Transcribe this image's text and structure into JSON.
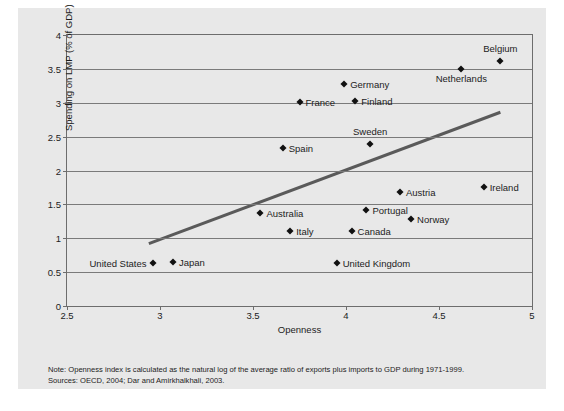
{
  "figure": {
    "background_color": "#e8e8e8",
    "note_line1": "Note: Openness index is calculated as the natural log of the average ratio of exports plus imports to GDP during 1971-1999.",
    "note_line2": "Sources: OECD, 2004; Dar and Amirkhalkhali, 2003."
  },
  "chart_data": {
    "type": "scatter",
    "title": "",
    "xlabel": "Openness",
    "ylabel": "Spending on LMP (% of GDP)",
    "xlim": [
      2.5,
      5
    ],
    "ylim": [
      0,
      4
    ],
    "xticks": [
      "2.5",
      "3",
      "3.5",
      "4",
      "4.5",
      "5"
    ],
    "xtick_values": [
      2.5,
      3,
      3.5,
      4,
      4.5,
      5
    ],
    "yticks": [
      "0",
      "0.5",
      "1",
      "1.5",
      "2",
      "2.5",
      "3",
      "3.5",
      "4"
    ],
    "ytick_values": [
      0,
      0.5,
      1,
      1.5,
      2,
      2.5,
      3,
      3.5,
      4
    ],
    "grid": "horizontal",
    "legend": "none",
    "marker_color": "#111111",
    "trendline_color": "#5a5a5a",
    "trendline": {
      "x0": 2.94,
      "y0": 0.92,
      "x1": 4.83,
      "y1": 2.86
    },
    "points": [
      {
        "label": "Belgium",
        "x": 4.83,
        "y": 3.62,
        "label_pos": "above"
      },
      {
        "label": "Netherlands",
        "x": 4.62,
        "y": 3.5,
        "label_pos": "below"
      },
      {
        "label": "Germany",
        "x": 3.99,
        "y": 3.28,
        "label_pos": "right"
      },
      {
        "label": "France",
        "x": 3.75,
        "y": 3.01,
        "label_pos": "right"
      },
      {
        "label": "Finland",
        "x": 4.05,
        "y": 3.02,
        "label_pos": "right"
      },
      {
        "label": "Sweden",
        "x": 4.13,
        "y": 2.39,
        "label_pos": "above"
      },
      {
        "label": "Spain",
        "x": 3.66,
        "y": 2.33,
        "label_pos": "right"
      },
      {
        "label": "Ireland",
        "x": 4.74,
        "y": 1.76,
        "label_pos": "right"
      },
      {
        "label": "Austria",
        "x": 4.29,
        "y": 1.69,
        "label_pos": "right"
      },
      {
        "label": "Portugal",
        "x": 4.11,
        "y": 1.42,
        "label_pos": "right"
      },
      {
        "label": "Australia",
        "x": 3.54,
        "y": 1.38,
        "label_pos": "right"
      },
      {
        "label": "Norway",
        "x": 4.35,
        "y": 1.29,
        "label_pos": "right"
      },
      {
        "label": "Canada",
        "x": 4.03,
        "y": 1.11,
        "label_pos": "right"
      },
      {
        "label": "Italy",
        "x": 3.7,
        "y": 1.1,
        "label_pos": "right"
      },
      {
        "label": "United Kingdom",
        "x": 3.95,
        "y": 0.63,
        "label_pos": "right"
      },
      {
        "label": "Japan",
        "x": 3.07,
        "y": 0.65,
        "label_pos": "right"
      },
      {
        "label": "United States",
        "x": 2.96,
        "y": 0.63,
        "label_pos": "left"
      }
    ]
  }
}
